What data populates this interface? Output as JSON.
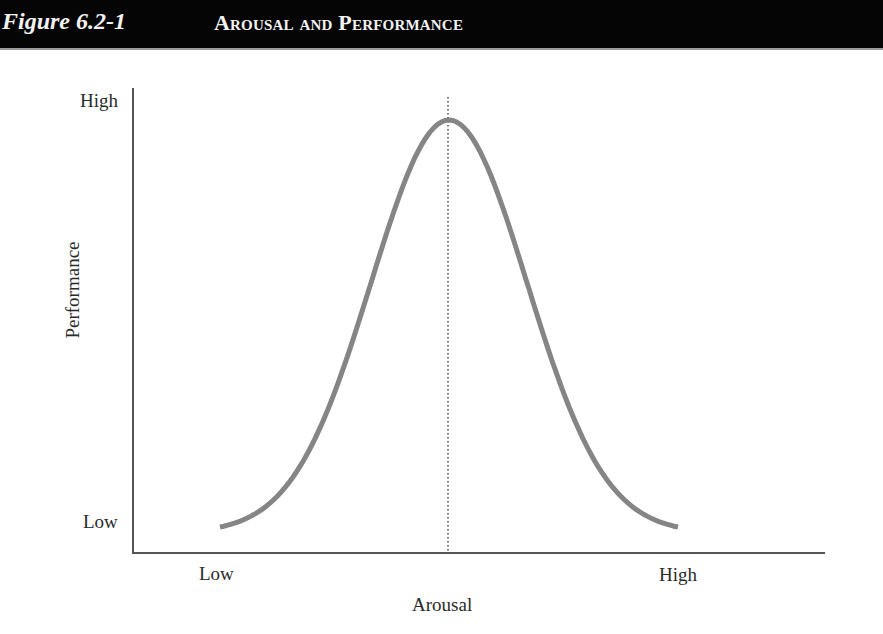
{
  "header": {
    "figure_number": "Figure 6.2-1",
    "figure_title": "Arousal and Performance"
  },
  "chart_data": {
    "type": "line",
    "title": "Arousal and Performance",
    "xlabel": "Arousal",
    "ylabel": "Performance",
    "x_tick_labels": [
      "Low",
      "High"
    ],
    "y_tick_labels": [
      "Low",
      "High"
    ],
    "grid": false,
    "legend": null,
    "annotations": [
      "Dotted vertical line at peak (optimal arousal)"
    ],
    "series": [
      {
        "name": "Performance",
        "color": "#858585",
        "description": "Inverted-U (bell-shaped) curve; performance peaks at moderate arousal",
        "x": [
          0.0,
          0.1,
          0.2,
          0.3,
          0.35,
          0.4,
          0.45,
          0.5,
          0.55,
          0.6,
          0.65,
          0.7,
          0.8,
          0.9,
          1.0
        ],
        "y": [
          0.02,
          0.07,
          0.18,
          0.45,
          0.66,
          0.85,
          0.97,
          1.0,
          0.97,
          0.85,
          0.66,
          0.45,
          0.18,
          0.07,
          0.02
        ]
      }
    ],
    "xlim": [
      0,
      1
    ],
    "ylim": [
      0,
      1
    ],
    "peak_x": 0.5
  },
  "axes": {
    "y_high": "High",
    "y_low": "Low",
    "x_low": "Low",
    "x_high": "High",
    "x_title": "Arousal",
    "y_title": "Performance"
  }
}
